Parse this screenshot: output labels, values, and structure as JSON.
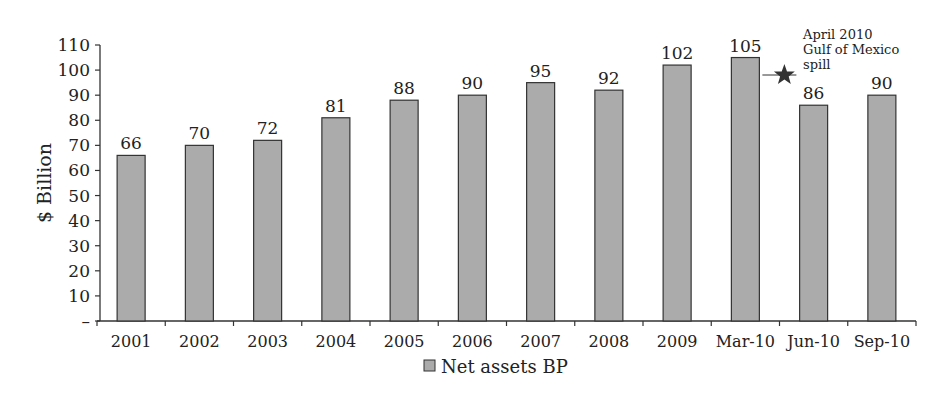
{
  "chart_data": {
    "type": "bar",
    "title": "",
    "xlabel": "",
    "ylabel": "$ Billion",
    "ylim": [
      0,
      110
    ],
    "yticks": [
      "–",
      "10",
      "20",
      "30",
      "40",
      "50",
      "60",
      "70",
      "80",
      "90",
      "100",
      "110"
    ],
    "categories": [
      "2001",
      "2002",
      "2003",
      "2004",
      "2005",
      "2006",
      "2007",
      "2008",
      "2009",
      "Mar-10",
      "Jun-10",
      "Sep-10"
    ],
    "series": [
      {
        "name": "Net assets BP",
        "values": [
          66,
          70,
          72,
          81,
          88,
          90,
          95,
          92,
          102,
          105,
          86,
          90
        ]
      }
    ],
    "legend": {
      "position": "bottom",
      "entries": [
        "Net assets BP"
      ]
    },
    "grid": false,
    "annotations": [
      {
        "text": [
          "April 2010",
          "Gulf of Mexico",
          "spill"
        ],
        "marker": "star",
        "between": [
          "Mar-10",
          "Jun-10"
        ]
      }
    ],
    "colors": {
      "bar_fill": "#ababab",
      "bar_stroke": "#333333",
      "axis": "#333333",
      "star": "#333333"
    }
  }
}
